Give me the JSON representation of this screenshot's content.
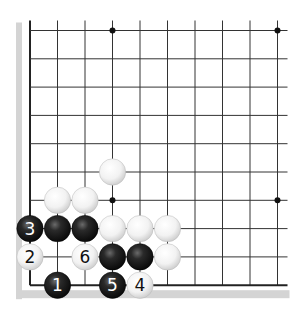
{
  "diagram": {
    "type": "go-board-corner",
    "grid": {
      "cols": 10,
      "rows": 10,
      "origin_x": 30,
      "origin_y": 30.5,
      "spacing_x": 27.5,
      "spacing_y": 28.3
    },
    "colors": {
      "line": "#333333",
      "edge_line": "#222222",
      "shadow": "#d4d4d4",
      "black_stone": "#1a1a1a",
      "white_stone": "#f4f4f4",
      "star_point": "#111111"
    },
    "star_points": [
      {
        "col": 3,
        "row": 0
      },
      {
        "col": 9,
        "row": 0
      },
      {
        "col": 3,
        "row": 6
      },
      {
        "col": 9,
        "row": 6
      }
    ],
    "stones": [
      {
        "color": "white",
        "col": 3,
        "row": 5,
        "label": ""
      },
      {
        "color": "white",
        "col": 1,
        "row": 6,
        "label": ""
      },
      {
        "color": "white",
        "col": 2,
        "row": 6,
        "label": ""
      },
      {
        "color": "black",
        "col": 0,
        "row": 7,
        "label": "3"
      },
      {
        "color": "black",
        "col": 1,
        "row": 7,
        "label": ""
      },
      {
        "color": "black",
        "col": 2,
        "row": 7,
        "label": ""
      },
      {
        "color": "white",
        "col": 3,
        "row": 7,
        "label": ""
      },
      {
        "color": "white",
        "col": 4,
        "row": 7,
        "label": ""
      },
      {
        "color": "white",
        "col": 5,
        "row": 7,
        "label": ""
      },
      {
        "color": "white",
        "col": 0,
        "row": 8,
        "label": "2"
      },
      {
        "color": "white",
        "col": 2,
        "row": 8,
        "label": "6"
      },
      {
        "color": "black",
        "col": 3,
        "row": 8,
        "label": ""
      },
      {
        "color": "black",
        "col": 4,
        "row": 8,
        "label": ""
      },
      {
        "color": "white",
        "col": 5,
        "row": 8,
        "label": ""
      },
      {
        "color": "black",
        "col": 1,
        "row": 9,
        "label": "1"
      },
      {
        "color": "black",
        "col": 3,
        "row": 9,
        "label": "5"
      },
      {
        "color": "white",
        "col": 4,
        "row": 9,
        "label": "4"
      }
    ]
  }
}
